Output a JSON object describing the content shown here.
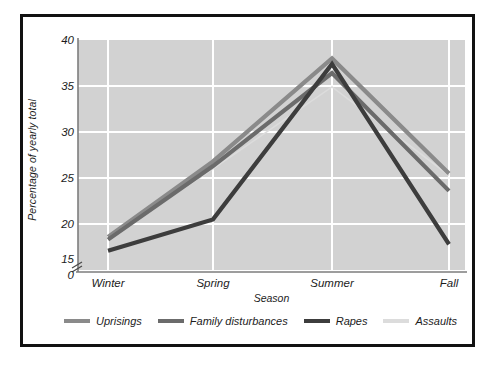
{
  "chart_data": {
    "type": "line",
    "title": "",
    "xlabel": "Season",
    "ylabel": "Percentage of yearly total",
    "categories": [
      "Winter",
      "Spring",
      "Summer",
      "Fall"
    ],
    "ylim": [
      15,
      40
    ],
    "yticks": [
      "0",
      "15",
      "20",
      "25",
      "30",
      "35",
      "40"
    ],
    "y_axis_break": true,
    "grid": true,
    "legend_position": "bottom",
    "series": [
      {
        "name": "Uprisings",
        "color": "#8a8a8a",
        "values": [
          18.6,
          26.8,
          38.0,
          25.5
        ]
      },
      {
        "name": "Family disturbances",
        "color": "#6b6b6b",
        "values": [
          18.3,
          26.3,
          36.4,
          23.6
        ]
      },
      {
        "name": "Rapes",
        "color": "#3d3d3d",
        "values": [
          17.1,
          20.5,
          37.4,
          17.8
        ]
      },
      {
        "name": "Assaults",
        "color": "#dcdcdc",
        "values": [
          18.4,
          26.0,
          34.9,
          25.3
        ]
      }
    ]
  },
  "yticks": {
    "t0": "0",
    "t15": "15",
    "t20": "20",
    "t25": "25",
    "t30": "30",
    "t35": "35",
    "t40": "40"
  },
  "xticks": {
    "winter": "Winter",
    "spring": "Spring",
    "summer": "Summer",
    "fall": "Fall"
  },
  "axis_titles": {
    "x": "Season",
    "y": "Percentage of yearly total"
  },
  "legend": {
    "items": [
      {
        "label": "Uprisings",
        "color": "#8a8a8a"
      },
      {
        "label": "Family disturbances",
        "color": "#6b6b6b"
      },
      {
        "label": "Rapes",
        "color": "#3d3d3d"
      },
      {
        "label": "Assaults",
        "color": "#dcdcdc"
      }
    ]
  },
  "colors": {
    "plot_background": "#d2d2d2",
    "gridline": "#ffffff",
    "frame": "#111111",
    "page_background": "#ffffff",
    "text": "#1c1c1c"
  }
}
